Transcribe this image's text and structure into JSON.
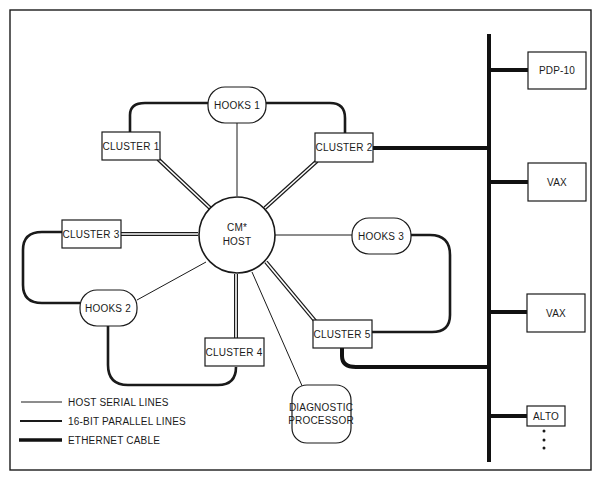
{
  "diagram": {
    "type": "network-topology",
    "center": {
      "label_line1": "CM*",
      "label_line2": "HOST"
    },
    "clusters": [
      {
        "id": "cluster1",
        "label": "CLUSTER 1"
      },
      {
        "id": "cluster2",
        "label": "CLUSTER 2"
      },
      {
        "id": "cluster3",
        "label": "CLUSTER 3"
      },
      {
        "id": "cluster4",
        "label": "CLUSTER 4"
      },
      {
        "id": "cluster5",
        "label": "CLUSTER 5"
      }
    ],
    "hooks": [
      {
        "id": "hooks1",
        "label": "HOOKS 1"
      },
      {
        "id": "hooks2",
        "label": "HOOKS 2"
      },
      {
        "id": "hooks3",
        "label": "HOOKS 3"
      }
    ],
    "diagnostic": {
      "label_line1": "DIAGNOSTIC",
      "label_line2": "PROCESSOR"
    },
    "ethernet_hosts": [
      {
        "id": "pdp10",
        "label": "PDP-10"
      },
      {
        "id": "vax1",
        "label": "VAX"
      },
      {
        "id": "vax2",
        "label": "VAX"
      },
      {
        "id": "alto",
        "label": "ALTO"
      }
    ],
    "continuation": "•\n•\n•",
    "edges": [
      {
        "from": "host",
        "to": "hooks1",
        "kind": "host-serial"
      },
      {
        "from": "host",
        "to": "hooks2",
        "kind": "host-serial"
      },
      {
        "from": "host",
        "to": "hooks3",
        "kind": "host-serial"
      },
      {
        "from": "host",
        "to": "diagnostic",
        "kind": "host-serial"
      },
      {
        "from": "host",
        "to": "cluster1",
        "kind": "16-bit-parallel"
      },
      {
        "from": "host",
        "to": "cluster2",
        "kind": "16-bit-parallel"
      },
      {
        "from": "host",
        "to": "cluster3",
        "kind": "16-bit-parallel"
      },
      {
        "from": "host",
        "to": "cluster4",
        "kind": "16-bit-parallel"
      },
      {
        "from": "host",
        "to": "cluster5",
        "kind": "16-bit-parallel"
      },
      {
        "from": "cluster1",
        "to": "hooks1",
        "kind": "bus"
      },
      {
        "from": "hooks1",
        "to": "cluster2",
        "kind": "bus"
      },
      {
        "from": "cluster3",
        "to": "hooks2",
        "kind": "bus"
      },
      {
        "from": "hooks2",
        "to": "cluster4",
        "kind": "bus"
      },
      {
        "from": "hooks3",
        "to": "cluster5",
        "kind": "bus"
      },
      {
        "from": "cluster2",
        "to": "ethernet",
        "kind": "ethernet"
      },
      {
        "from": "cluster5",
        "to": "ethernet",
        "kind": "ethernet"
      },
      {
        "from": "pdp10",
        "to": "ethernet",
        "kind": "ethernet"
      },
      {
        "from": "vax1",
        "to": "ethernet",
        "kind": "ethernet"
      },
      {
        "from": "vax2",
        "to": "ethernet",
        "kind": "ethernet"
      },
      {
        "from": "alto",
        "to": "ethernet",
        "kind": "ethernet"
      }
    ]
  },
  "legend": {
    "items": [
      {
        "label": "HOST SERIAL LINES"
      },
      {
        "label": "16-BIT PARALLEL LINES"
      },
      {
        "label": "ETHERNET CABLE"
      }
    ]
  }
}
